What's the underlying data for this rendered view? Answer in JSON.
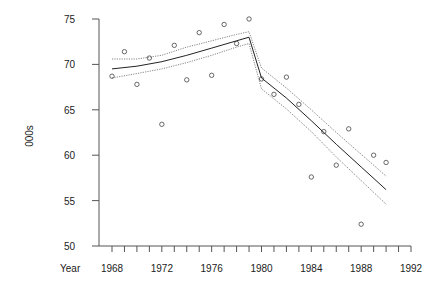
{
  "chart_data": {
    "type": "scatter",
    "title": "",
    "xlabel": "Year",
    "ylabel": "000s",
    "xlim": [
      1968,
      1992
    ],
    "ylim": [
      50,
      75
    ],
    "x_ticks": [
      1968,
      1972,
      1976,
      1980,
      1984,
      1988,
      1992
    ],
    "x_minor_step": 1,
    "y_ticks": [
      50,
      55,
      60,
      65,
      70,
      75
    ],
    "grid": false,
    "legend": null,
    "series": [
      {
        "name": "observed",
        "style": "open-circle",
        "x": [
          1968,
          1969,
          1970,
          1971,
          1972,
          1973,
          1974,
          1975,
          1976,
          1977,
          1978,
          1979,
          1980,
          1981,
          1982,
          1983,
          1984,
          1985,
          1986,
          1987,
          1988,
          1989,
          1990
        ],
        "y": [
          68.7,
          71.4,
          67.8,
          70.7,
          63.4,
          72.1,
          68.3,
          73.5,
          68.8,
          74.4,
          72.3,
          75.0,
          68.4,
          66.7,
          68.6,
          65.6,
          57.6,
          62.6,
          58.9,
          62.9,
          52.4,
          60.0,
          59.2
        ]
      },
      {
        "name": "fitted",
        "style": "solid-line",
        "x": [
          1968,
          1970,
          1972,
          1974,
          1976,
          1978,
          1979,
          1980,
          1982,
          1984,
          1986,
          1988,
          1990
        ],
        "y": [
          69.5,
          69.8,
          70.3,
          71.0,
          71.8,
          72.6,
          73.0,
          68.5,
          66.3,
          63.8,
          61.2,
          58.7,
          56.2
        ]
      },
      {
        "name": "upper band",
        "style": "dotted-line",
        "x": [
          1968,
          1970,
          1972,
          1974,
          1976,
          1978,
          1979,
          1980,
          1982,
          1984,
          1986,
          1988,
          1990
        ],
        "y": [
          70.6,
          70.6,
          71.0,
          71.9,
          72.6,
          73.3,
          73.6,
          69.6,
          67.4,
          65.0,
          62.5,
          60.1,
          57.7
        ]
      },
      {
        "name": "lower band",
        "style": "dotted-line",
        "x": [
          1968,
          1970,
          1972,
          1974,
          1976,
          1978,
          1979,
          1980,
          1982,
          1984,
          1986,
          1988,
          1990
        ],
        "y": [
          68.5,
          69.0,
          69.5,
          70.2,
          71.0,
          71.9,
          72.3,
          67.3,
          65.1,
          62.6,
          59.8,
          57.2,
          54.6
        ]
      }
    ]
  }
}
